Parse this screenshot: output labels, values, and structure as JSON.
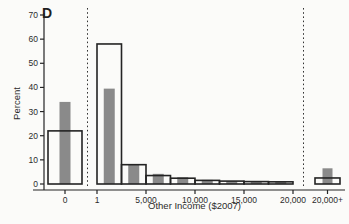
{
  "window": {
    "background": "#fbfbf9"
  },
  "chart_data": {
    "type": "bar",
    "subtype": "histogram-two-series-with-topcoded-categories",
    "panel_label": "D",
    "title": "",
    "xlabel": "Other Income ($2007)",
    "ylabel": "Percent",
    "ylim": [
      0,
      70
    ],
    "yticks": [
      "0",
      "10",
      "20",
      "30",
      "40",
      "50",
      "60",
      "70"
    ],
    "grid": false,
    "legend": "none",
    "colors": {
      "solid_bar": "#8a8a8a",
      "outline": "#242424",
      "axis": "#242424",
      "text": "#2b2b2b",
      "dashed_line": "#333333"
    },
    "series": [
      {
        "name": "hollow-outline-bars",
        "style": "hollow"
      },
      {
        "name": "gray-solid-bars",
        "style": "solid"
      }
    ],
    "zero_bin": {
      "tick_label": "0",
      "hollow": 22,
      "gray": 34
    },
    "main_bins": {
      "tick_labels": [
        "1",
        "5,000",
        "10,000",
        "15,000",
        "20,000"
      ],
      "bin_width_dollars": 2500,
      "hollow": [
        58,
        8,
        3.5,
        2.4,
        1.5,
        1.2,
        1.0,
        0.9
      ],
      "gray": [
        39.5,
        8,
        4.2,
        2.8,
        1.7,
        1.2,
        1.0,
        0.9
      ]
    },
    "topcode_bin": {
      "tick_label": "20,000+",
      "hollow": 2.5,
      "gray": 6.5
    },
    "separators": {
      "style": "dashed-vertical",
      "count": 2
    }
  }
}
